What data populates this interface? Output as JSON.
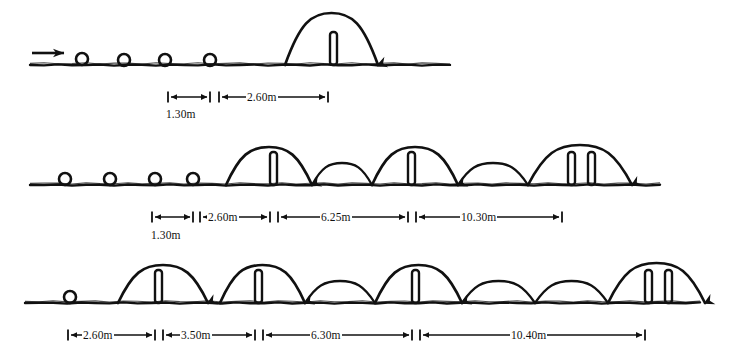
{
  "figure": {
    "kind": "hand-drawn-technical-sketch",
    "ink_color": "#111111",
    "background_color": "#ffffff",
    "rows": [
      {
        "id": "row-1",
        "ground_line": {
          "x1": 30,
          "x2": 450,
          "y": 65
        },
        "direction_arrow": {
          "x": 32,
          "y": 53,
          "length": 32,
          "label": "direction-of-travel"
        },
        "footfall_circles": [
          {
            "cx": 82,
            "cy": 59,
            "r": 6
          },
          {
            "cx": 124,
            "cy": 60,
            "r": 6
          },
          {
            "cx": 165,
            "cy": 60,
            "r": 6
          },
          {
            "cx": 210,
            "cy": 60,
            "r": 6
          }
        ],
        "hurdles": [
          {
            "x": 330,
            "y_top": 32,
            "width": 7,
            "height": 33,
            "count": 1
          }
        ],
        "arcs": [
          {
            "start_x": 285,
            "end_x": 378,
            "apex_y": 13,
            "type": "hurdle-clearance",
            "landing_arrow": true
          }
        ],
        "small_arcs": [],
        "dimensions": [
          {
            "id": "r1-d1",
            "value": "1.30m",
            "x1": 168,
            "x2": 210,
            "y": 97,
            "label_position": "below",
            "label_x": 165,
            "label_y": 108
          },
          {
            "id": "r1-d2",
            "value": "2.60m",
            "x1": 219,
            "x2": 328,
            "y": 97,
            "label_position": "inline",
            "label_x": 246,
            "label_y": 91
          }
        ]
      },
      {
        "id": "row-2",
        "ground_line": {
          "x1": 30,
          "x2": 660,
          "y": 185
        },
        "direction_arrow": null,
        "footfall_circles": [
          {
            "cx": 65,
            "cy": 179,
            "r": 6
          },
          {
            "cx": 110,
            "cy": 179,
            "r": 6
          },
          {
            "cx": 155,
            "cy": 179,
            "r": 6
          },
          {
            "cx": 193,
            "cy": 179,
            "r": 6
          }
        ],
        "hurdles": [
          {
            "x": 270,
            "y_top": 152,
            "width": 7,
            "height": 33,
            "count": 1
          },
          {
            "x": 408,
            "y_top": 152,
            "width": 7,
            "height": 33,
            "count": 1
          },
          {
            "x": 568,
            "y_top": 152,
            "width": 7,
            "height": 33,
            "count": 2
          }
        ],
        "arcs": [
          {
            "start_x": 226,
            "end_x": 312,
            "apex_y": 147,
            "type": "hurdle-clearance",
            "landing_arrow": true
          },
          {
            "start_x": 372,
            "end_x": 458,
            "apex_y": 147,
            "type": "hurdle-clearance",
            "landing_arrow": true
          },
          {
            "start_x": 528,
            "end_x": 632,
            "apex_y": 145,
            "type": "hurdle-clearance-double",
            "landing_arrow": true
          }
        ],
        "small_arcs": [
          {
            "start_x": 312,
            "end_x": 372,
            "apex_y": 163
          },
          {
            "start_x": 458,
            "end_x": 528,
            "apex_y": 163
          }
        ],
        "dimensions": [
          {
            "id": "r2-d1",
            "value": "1.30m",
            "x1": 152,
            "x2": 193,
            "y": 217,
            "label_position": "below",
            "label_x": 150,
            "label_y": 229
          },
          {
            "id": "r2-d2",
            "value": "2.60m",
            "x1": 200,
            "x2": 270,
            "y": 217,
            "label_position": "inline",
            "label_x": 207,
            "label_y": 211
          },
          {
            "id": "r2-d3",
            "value": "6.25m",
            "x1": 278,
            "x2": 408,
            "y": 217,
            "label_position": "inline",
            "label_x": 320,
            "label_y": 211
          },
          {
            "id": "r2-d4",
            "value": "10.30m",
            "x1": 416,
            "x2": 562,
            "y": 217,
            "label_position": "inline",
            "label_x": 460,
            "label_y": 211
          }
        ]
      },
      {
        "id": "row-3",
        "ground_line": {
          "x1": 25,
          "x2": 700,
          "y": 303
        },
        "direction_arrow": null,
        "footfall_circles": [
          {
            "cx": 70,
            "cy": 297,
            "r": 6
          }
        ],
        "hurdles": [
          {
            "x": 155,
            "y_top": 270,
            "width": 7,
            "height": 33,
            "count": 1
          },
          {
            "x": 255,
            "y_top": 270,
            "width": 7,
            "height": 33,
            "count": 1
          },
          {
            "x": 412,
            "y_top": 270,
            "width": 7,
            "height": 33,
            "count": 1
          },
          {
            "x": 645,
            "y_top": 270,
            "width": 7,
            "height": 33,
            "count": 2
          }
        ],
        "arcs": [
          {
            "start_x": 118,
            "end_x": 208,
            "apex_y": 265,
            "type": "hurdle-clearance",
            "landing_arrow": true
          },
          {
            "start_x": 220,
            "end_x": 305,
            "apex_y": 265,
            "type": "hurdle-clearance",
            "landing_arrow": true
          },
          {
            "start_x": 375,
            "end_x": 462,
            "apex_y": 265,
            "type": "hurdle-clearance",
            "landing_arrow": true
          },
          {
            "start_x": 608,
            "end_x": 705,
            "apex_y": 263,
            "type": "hurdle-clearance-double",
            "landing_arrow": true
          }
        ],
        "small_arcs": [
          {
            "start_x": 305,
            "end_x": 375,
            "apex_y": 281
          },
          {
            "start_x": 462,
            "end_x": 535,
            "apex_y": 281
          },
          {
            "start_x": 535,
            "end_x": 608,
            "apex_y": 281
          }
        ],
        "dimensions": [
          {
            "id": "r3-d1",
            "value": "2.60m",
            "x1": 68,
            "x2": 155,
            "y": 335,
            "label_position": "inline",
            "label_x": 82,
            "label_y": 329
          },
          {
            "id": "r3-d2",
            "value": "3.50m",
            "x1": 163,
            "x2": 255,
            "y": 335,
            "label_position": "inline",
            "label_x": 180,
            "label_y": 329
          },
          {
            "id": "r3-d3",
            "value": "6.30m",
            "x1": 263,
            "x2": 412,
            "y": 335,
            "label_position": "inline",
            "label_x": 310,
            "label_y": 329
          },
          {
            "id": "r3-d4",
            "value": "10.40m",
            "x1": 420,
            "x2": 645,
            "y": 335,
            "label_position": "inline",
            "label_x": 510,
            "label_y": 329
          }
        ]
      }
    ]
  }
}
